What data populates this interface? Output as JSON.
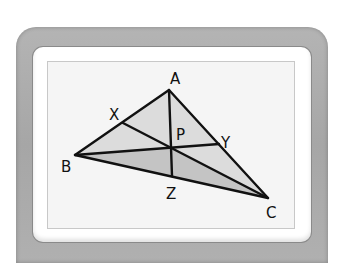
{
  "diagram": {
    "type": "triangle-concurrency",
    "points": {
      "A": {
        "label": "A",
        "x": 169,
        "y": 90
      },
      "B": {
        "label": "B",
        "x": 75,
        "y": 155
      },
      "C": {
        "label": "C",
        "x": 268,
        "y": 198
      },
      "X": {
        "label": "X",
        "x": 123,
        "y": 123
      },
      "Y": {
        "label": "Y",
        "x": 219,
        "y": 144
      },
      "Z": {
        "label": "Z",
        "x": 172,
        "y": 176
      },
      "P": {
        "label": "P",
        "x": 171,
        "y": 149
      }
    },
    "segments": [
      "AB",
      "BC",
      "CA",
      "AZ",
      "BY",
      "CX"
    ],
    "shading": {
      "light_region": "triangle ABC",
      "dark_region": "triangle BPC",
      "light_color": "#dcdcdc",
      "dark_color": "#c4c4c4"
    }
  },
  "device": {
    "bezel_color": "#aaaaaa",
    "frame_color": "#ffffff",
    "screen_color": "#f5f5f5"
  }
}
